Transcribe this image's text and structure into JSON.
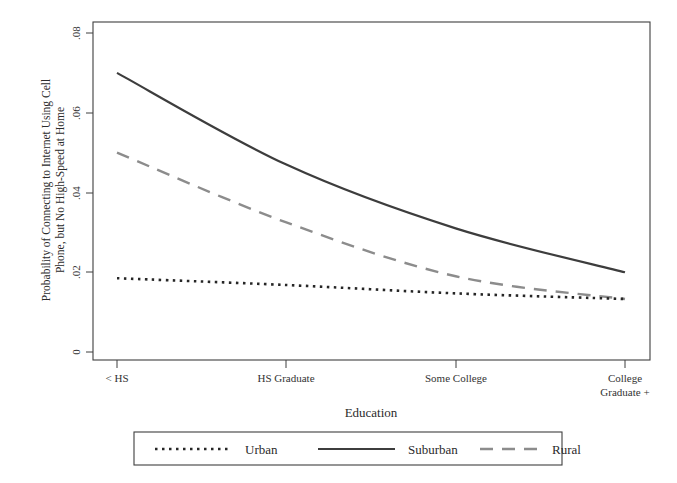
{
  "chart_data": {
    "type": "line",
    "title": "",
    "xlabel": "Education",
    "ylabel_line1": "Probability of Connecting to Internet Using Cell",
    "ylabel_line2": "Phone, but No High-Speed at Home",
    "categories": [
      "< HS",
      "HS Graduate",
      "Some College",
      "College Graduate +"
    ],
    "xtick_labels": [
      "< HS",
      "HS Graduate",
      "Some College",
      "College",
      "Graduate +"
    ],
    "ytick_labels": [
      "0",
      ".02",
      ".04",
      ".06",
      ".08"
    ],
    "ytick_values": [
      0,
      0.02,
      0.04,
      0.06,
      0.08
    ],
    "ylim": [
      0,
      0.08
    ],
    "grid": false,
    "legend_position": "bottom-outside",
    "series": [
      {
        "name": "Urban",
        "style": "dotted",
        "color": "#262626",
        "values": [
          0.0185,
          0.0168,
          0.0147,
          0.0133
        ]
      },
      {
        "name": "Suburban",
        "style": "solid",
        "color": "#3d3d3d",
        "values": [
          0.07,
          0.047,
          0.031,
          0.02
        ]
      },
      {
        "name": "Rural",
        "style": "dashed",
        "color": "#8c8c8c",
        "values": [
          0.05,
          0.0325,
          0.019,
          0.0133
        ]
      }
    ]
  },
  "axis": {
    "x_title": "Education",
    "y_title_line1": "Probability of Connecting to Internet Using Cell",
    "y_title_line2": "Phone, but No High-Speed at Home"
  },
  "legend": {
    "entries": [
      {
        "label": "Urban",
        "style": "dotted"
      },
      {
        "label": "Suburban",
        "style": "solid"
      },
      {
        "label": "Rural",
        "style": "dashed"
      }
    ]
  }
}
